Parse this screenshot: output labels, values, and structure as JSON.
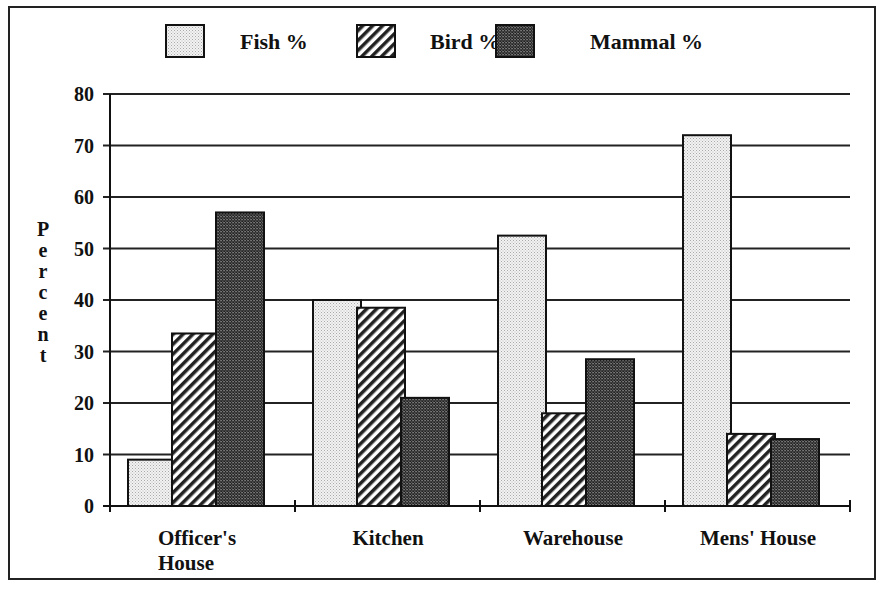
{
  "chart_data": {
    "type": "bar",
    "title": "",
    "xlabel": "",
    "ylabel": "Percent",
    "ylim": [
      0,
      80
    ],
    "yticks": [
      0,
      10,
      20,
      30,
      40,
      50,
      60,
      70,
      80
    ],
    "grid": true,
    "legend_position": "top",
    "categories": [
      "Officer's House",
      "Kitchen",
      "Warehouse",
      "Mens' House"
    ],
    "series": [
      {
        "name": "Fish %",
        "pattern": "light-dots",
        "values": [
          9,
          40,
          52.5,
          72
        ]
      },
      {
        "name": "Bird %",
        "pattern": "diagonal-hatch",
        "values": [
          33.5,
          38.5,
          18,
          14
        ]
      },
      {
        "name": "Mammal %",
        "pattern": "dark-checker",
        "values": [
          57,
          21,
          28.5,
          13
        ]
      }
    ]
  },
  "legend": [
    "Fish %",
    "Bird %",
    "Mammal %"
  ],
  "ylabel_letters": [
    "P",
    "e",
    "r",
    "c",
    "e",
    "n",
    "t"
  ],
  "category_lines": [
    [
      "Officer's",
      "House"
    ],
    [
      "Kitchen"
    ],
    [
      "Warehouse"
    ],
    [
      "Mens' House"
    ]
  ]
}
